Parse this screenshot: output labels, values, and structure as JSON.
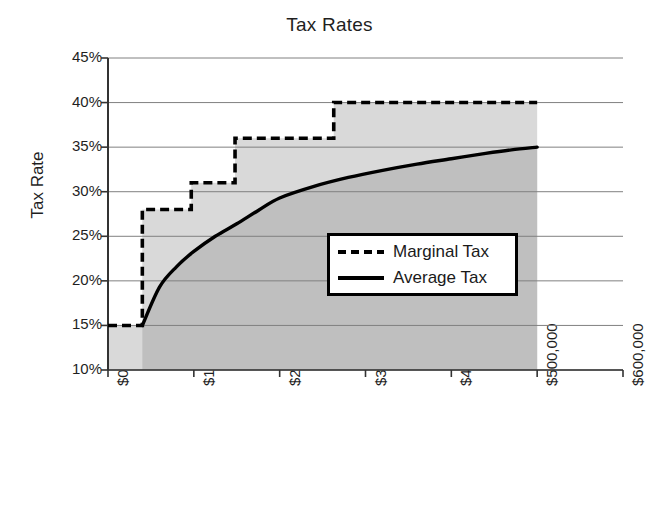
{
  "chart_data": {
    "type": "line",
    "title": "Tax Rates",
    "xlabel": "Taxable Income",
    "ylabel": "Tax Rate",
    "xlim": [
      0,
      600000
    ],
    "ylim": [
      0.1,
      0.45
    ],
    "grid": true,
    "legend_position": "center-right",
    "x_tick_labels": [
      "$0",
      "$100,000",
      "$200,000",
      "$300,000",
      "$400,000",
      "$500,000",
      "$600,000"
    ],
    "x_tick_values": [
      0,
      100000,
      200000,
      300000,
      400000,
      500000,
      600000
    ],
    "y_tick_labels": [
      "10%",
      "15%",
      "20%",
      "25%",
      "30%",
      "35%",
      "40%",
      "45%"
    ],
    "y_tick_values": [
      10,
      15,
      20,
      25,
      30,
      35,
      40,
      45
    ],
    "series": [
      {
        "name": "Marginal Tax",
        "style": "dashed",
        "color": "#000000",
        "kind": "step",
        "brackets": [
          {
            "from": 0,
            "to": 40000,
            "rate": 15
          },
          {
            "from": 40000,
            "to": 97000,
            "rate": 28
          },
          {
            "from": 97000,
            "to": 148000,
            "rate": 31
          },
          {
            "from": 148000,
            "to": 263000,
            "rate": 36
          },
          {
            "from": 263000,
            "to": 500000,
            "rate": 40
          }
        ]
      },
      {
        "name": "Average Tax",
        "style": "solid",
        "color": "#000000",
        "kind": "curve",
        "x": [
          40000,
          60000,
          80000,
          100000,
          125000,
          150000,
          175000,
          200000,
          240000,
          280000,
          320000,
          360000,
          400000,
          440000,
          470000,
          500000
        ],
        "values": [
          15.0,
          19.3,
          21.6,
          23.3,
          25.0,
          26.4,
          27.9,
          29.3,
          30.6,
          31.6,
          32.4,
          33.1,
          33.7,
          34.3,
          34.7,
          35.0
        ]
      }
    ],
    "fills": [
      {
        "name": "area-above-average-under-marginal",
        "color": "#d9d9d9"
      },
      {
        "name": "area-under-average",
        "color": "#bfbfbf"
      }
    ]
  },
  "legend": {
    "entries": [
      {
        "label": "Marginal Tax",
        "swatch": "dashed-line-swatch"
      },
      {
        "label": "Average Tax",
        "swatch": "solid-line-swatch"
      }
    ]
  },
  "colors": {
    "axis": "#4d4d4d",
    "grid": "#808080",
    "line": "#000000",
    "fill_light": "#d9d9d9",
    "fill_dark": "#bfbfbf",
    "background": "#ffffff"
  }
}
